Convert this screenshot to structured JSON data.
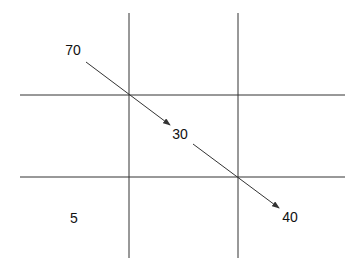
{
  "diagram": {
    "type": "grid-with-arrows",
    "colors": {
      "background": "#ffffff",
      "line": "#333333",
      "text": "#111111"
    },
    "grid": {
      "vertical_lines_x": [
        129,
        238
      ],
      "vertical_span_y": [
        13,
        258
      ],
      "horizontal_lines_y": [
        95,
        177
      ],
      "horizontal_span_x": [
        20,
        345
      ]
    },
    "labels": [
      {
        "id": "top-left",
        "text": "70",
        "x": 73,
        "y": 50
      },
      {
        "id": "center",
        "text": "30",
        "x": 180,
        "y": 134
      },
      {
        "id": "bottom-left",
        "text": "5",
        "x": 74,
        "y": 218
      },
      {
        "id": "bottom-right",
        "text": "40",
        "x": 290,
        "y": 217
      }
    ],
    "arrows": [
      {
        "from_label": "70",
        "to_label": "30",
        "x1": 86,
        "y1": 62,
        "x2": 170,
        "y2": 125
      },
      {
        "from_label": "30",
        "to_label": "40",
        "x1": 193,
        "y1": 144,
        "x2": 279,
        "y2": 208
      }
    ]
  }
}
